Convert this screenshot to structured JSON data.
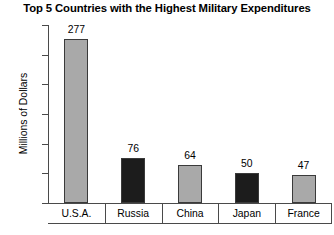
{
  "chart_data": {
    "type": "bar",
    "title": "Top 5 Countries with the Highest Military Expenditures",
    "xlabel": "",
    "ylabel": "Millions of Dollars",
    "categories": [
      "U.S.A.",
      "Russia",
      "China",
      "Japan",
      "France"
    ],
    "values": [
      277,
      76,
      64,
      50,
      47
    ],
    "value_labels": [
      "277",
      "76",
      "64",
      "50",
      "47"
    ],
    "bar_colors": [
      "#a9a9a9",
      "#1c1c1c",
      "#a9a9a9",
      "#1c1c1c",
      "#a9a9a9"
    ],
    "bar_outline_color": "#3a3a3a",
    "ylim": [
      0,
      300
    ],
    "yticks": [
      300,
      250,
      200,
      150,
      100,
      50,
      0
    ],
    "ytick_labels": [
      "300",
      "250",
      "200",
      "150",
      "100",
      "50",
      "0"
    ],
    "grid": false,
    "legend": null,
    "axis_color": "#4a4a4a",
    "background": "#ffffff"
  }
}
